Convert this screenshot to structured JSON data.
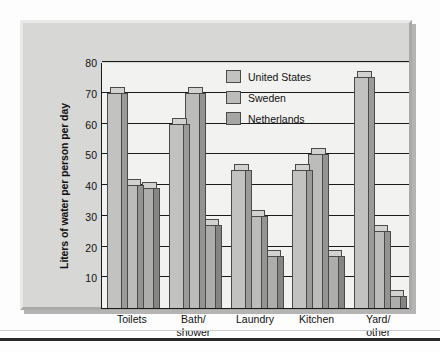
{
  "chart_data": {
    "type": "bar",
    "title": "",
    "xlabel": "",
    "ylabel": "Liters of water per person per day",
    "ylim": [
      0,
      80
    ],
    "yticks": [
      10,
      20,
      30,
      40,
      50,
      60,
      70,
      80
    ],
    "grid": true,
    "legend_position": "top-center",
    "categories": [
      "Toilets",
      "Bath/ shower",
      "Laundry",
      "Kitchen",
      "Yard/ other"
    ],
    "category_lines": [
      [
        "Toilets"
      ],
      [
        "Bath/",
        "shower"
      ],
      [
        "Laundry"
      ],
      [
        "Kitchen"
      ],
      [
        "Yard/",
        "other"
      ]
    ],
    "series": [
      {
        "name": "United States",
        "color": "#c2c2c0",
        "values": [
          70,
          60,
          45,
          45,
          75
        ]
      },
      {
        "name": "Sweden",
        "color": "#bcbcba",
        "values": [
          40,
          70,
          30,
          50,
          25
        ]
      },
      {
        "name": "Netherlands",
        "color": "#a6a6a4",
        "values": [
          39,
          27,
          17,
          17,
          4
        ]
      }
    ]
  },
  "legend": {
    "items": [
      {
        "label": "United States"
      },
      {
        "label": "Sweden"
      },
      {
        "label": "Netherlands"
      }
    ]
  },
  "axis": {
    "y_title": "Liters of water per person per day"
  }
}
